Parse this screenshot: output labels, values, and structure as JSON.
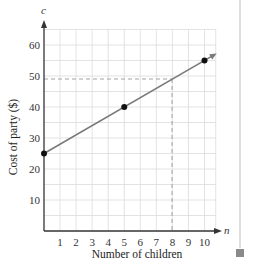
{
  "chart_data": {
    "type": "line",
    "title": "",
    "xlabel": "Number of children",
    "ylabel": "Cost of party ($)",
    "x_var": "n",
    "y_var": "c",
    "xlim": [
      0,
      10.7
    ],
    "ylim": [
      0,
      65
    ],
    "x_ticks": [
      1,
      2,
      3,
      4,
      5,
      6,
      7,
      8,
      9,
      10
    ],
    "y_ticks": [
      10,
      20,
      30,
      40,
      50,
      60
    ],
    "grid": true,
    "grid_x_step": 1,
    "grid_y_step": 5,
    "series": [
      {
        "name": "cost",
        "line": {
          "x": [
            0,
            10.6
          ],
          "y": [
            25,
            56.8
          ]
        },
        "points": [
          {
            "x": 0,
            "y": 25
          },
          {
            "x": 5,
            "y": 40
          },
          {
            "x": 10,
            "y": 55
          }
        ]
      }
    ],
    "annotations": [
      {
        "type": "dashed-guide",
        "x": 8,
        "y": 49,
        "description": "dashed lines from c=49 on y-axis and n=8 on x-axis meeting on the line"
      }
    ],
    "legend": null
  },
  "labels": {
    "xlabel": "Number of children",
    "ylabel": "Cost of party ($)",
    "x_var": "n",
    "y_var": "c",
    "x_ticks": [
      "1",
      "2",
      "3",
      "4",
      "5",
      "6",
      "7",
      "8",
      "9",
      "10"
    ],
    "y_ticks": [
      "10",
      "20",
      "30",
      "40",
      "50",
      "60"
    ]
  },
  "colors": {
    "line": "#7a7a7a",
    "point": "#111111",
    "grid": "#dcdcdc",
    "axis": "#333333",
    "side_marker": "#8a8a8a"
  }
}
